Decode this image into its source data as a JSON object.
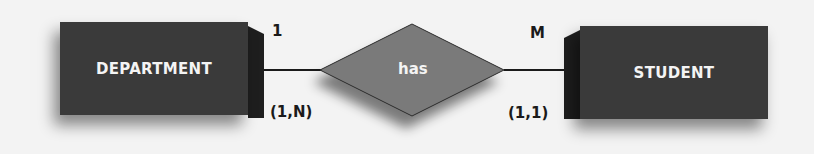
{
  "diagram": {
    "type": "ER diagram",
    "entities": [
      {
        "name": "DEPARTMENT",
        "cardinality_label": "1",
        "participation": "(1,N)"
      },
      {
        "name": "STUDENT",
        "cardinality_label": "M",
        "participation": "(1,1)"
      }
    ],
    "relationship": {
      "name": "has"
    },
    "colors": {
      "entity_fill": "#3a3a3a",
      "relationship_fill": "#7a7a7a",
      "text_light": "#f4f4f4",
      "text_dark": "#1a1a1a",
      "background": "#f3f3f3"
    }
  }
}
